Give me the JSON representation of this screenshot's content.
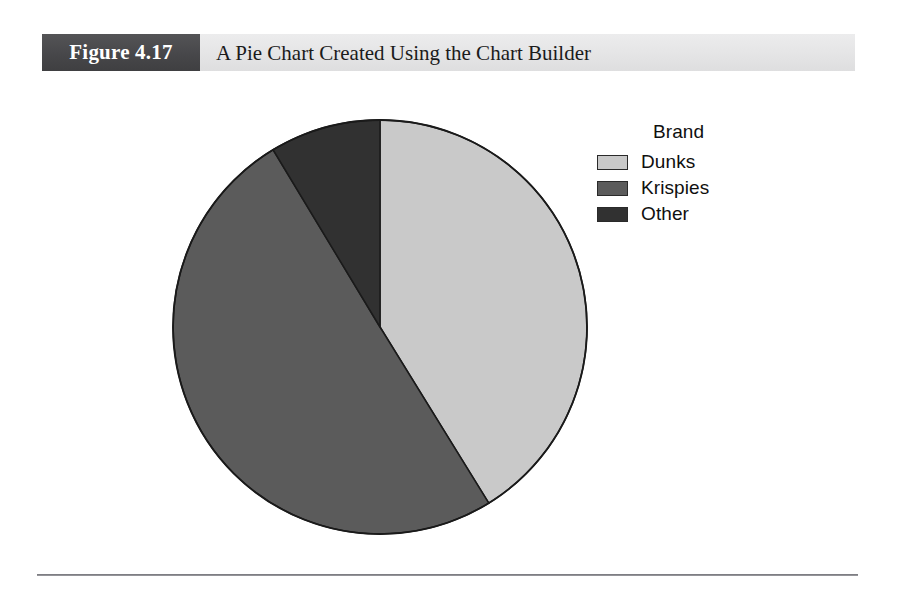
{
  "figure": {
    "number_label": "Figure 4.17",
    "caption_title": "A Pie Chart Created Using the Chart Builder",
    "number_box_color": "#47474a",
    "caption_bar_color": "#e6e6e7"
  },
  "legend": {
    "title": "Brand",
    "items": [
      {
        "label": "Dunks",
        "swatch_name": "legend-swatch-dunks",
        "color": "#c9c9c9"
      },
      {
        "label": "Krispies",
        "swatch_name": "legend-swatch-krispies",
        "color": "#5b5b5b"
      },
      {
        "label": "Other",
        "swatch_name": "legend-swatch-other",
        "color": "#313131"
      }
    ]
  },
  "chart_data": {
    "type": "pie",
    "title": "A Pie Chart Created Using the Chart Builder",
    "legend_title": "Brand",
    "legend_position": "right",
    "categories": [
      "Dunks",
      "Krispies",
      "Other"
    ],
    "values": [
      41.2,
      50.3,
      8.5
    ],
    "value_unit": "percent",
    "colors": [
      "#c9c9c9",
      "#5b5b5b",
      "#313131"
    ],
    "slice_start_angles_deg": [
      0,
      148.3,
      328.9
    ],
    "slice_sweep_angles_deg": [
      148.3,
      180.6,
      31.1
    ],
    "start_angle_deg": 0,
    "direction": "clockwise",
    "outline_color": "#1a1a1a",
    "labels_shown": false,
    "grid": false,
    "center_px": [
      338,
      241
    ],
    "radius_px": 207
  }
}
